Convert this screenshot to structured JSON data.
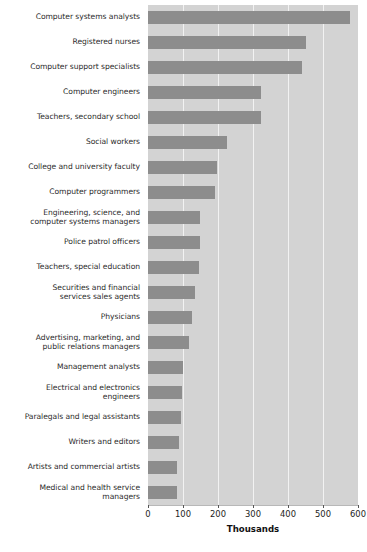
{
  "chart_data": {
    "type": "bar",
    "orientation": "horizontal",
    "title": "",
    "subtitle": "",
    "xlabel": "Thousands",
    "ylabel": "",
    "xlim": [
      0,
      600
    ],
    "ylim": null,
    "grid": "vertical",
    "legend": null,
    "legend_position": "none",
    "xticks": [
      0,
      100,
      200,
      300,
      400,
      500,
      600
    ],
    "xtick_labels": [
      "0",
      "100",
      "200",
      "300",
      "400",
      "500",
      "600"
    ],
    "categories": [
      "Computer systems analysts",
      "Registered nurses",
      "Computer support specialists",
      "Computer engineers",
      "Teachers, secondary school",
      "Social workers",
      "College and university faculty",
      "Computer programmers",
      "Engineering, science, and computer systems managers",
      "Police patrol officers",
      "Teachers, special education",
      "Securities and financial services sales agents",
      "Physicians",
      "Advertising, marketing, and public relations managers",
      "Management analysts",
      "Electrical and electronics engineers",
      "Paralegals and legal assistants",
      "Writers and editors",
      "Artists and commercial artists",
      "Medical and health service managers"
    ],
    "values": [
      577,
      451,
      439,
      323,
      322,
      226,
      196,
      191,
      149,
      148,
      147,
      133,
      125,
      116,
      100,
      96,
      93,
      89,
      83,
      82
    ],
    "value_unit": "thousands",
    "series": [
      {
        "name": "Projected job growth",
        "values": [
          577,
          451,
          439,
          323,
          322,
          226,
          196,
          191,
          149,
          148,
          147,
          133,
          125,
          116,
          100,
          96,
          93,
          89,
          83,
          82
        ]
      }
    ]
  },
  "labels": [
    {
      "lines": [
        "Computer systems analysts"
      ]
    },
    {
      "lines": [
        "Registered nurses"
      ]
    },
    {
      "lines": [
        "Computer support specialists"
      ]
    },
    {
      "lines": [
        "Computer engineers"
      ]
    },
    {
      "lines": [
        "Teachers, secondary school"
      ]
    },
    {
      "lines": [
        "Social workers"
      ]
    },
    {
      "lines": [
        "College and university faculty"
      ]
    },
    {
      "lines": [
        "Computer programmers"
      ]
    },
    {
      "lines": [
        "Engineering, science, and",
        "computer systems managers"
      ]
    },
    {
      "lines": [
        "Police patrol officers"
      ]
    },
    {
      "lines": [
        "Teachers, special education"
      ]
    },
    {
      "lines": [
        "Securities and financial",
        "services sales agents"
      ]
    },
    {
      "lines": [
        "Physicians"
      ]
    },
    {
      "lines": [
        "Advertising, marketing, and",
        "public relations managers"
      ]
    },
    {
      "lines": [
        "Management analysts"
      ]
    },
    {
      "lines": [
        "Electrical and electronics",
        "engineers"
      ]
    },
    {
      "lines": [
        "Paralegals and legal assistants"
      ]
    },
    {
      "lines": [
        "Writers and editors"
      ]
    },
    {
      "lines": [
        "Artists and commercial artists"
      ]
    },
    {
      "lines": [
        "Medical and health service",
        "managers"
      ]
    }
  ],
  "axis": {
    "title": "Thousands",
    "ticks": [
      "0",
      "100",
      "200",
      "300",
      "400",
      "500",
      "600"
    ]
  },
  "colors": {
    "bar": "#8d8d8d",
    "plot_background": "#d3d3d3",
    "gridline": "#f2f2f2",
    "page_background": "#ffffff",
    "label_text": "#2b2b2b",
    "axis_text": "#1d1d1d"
  }
}
